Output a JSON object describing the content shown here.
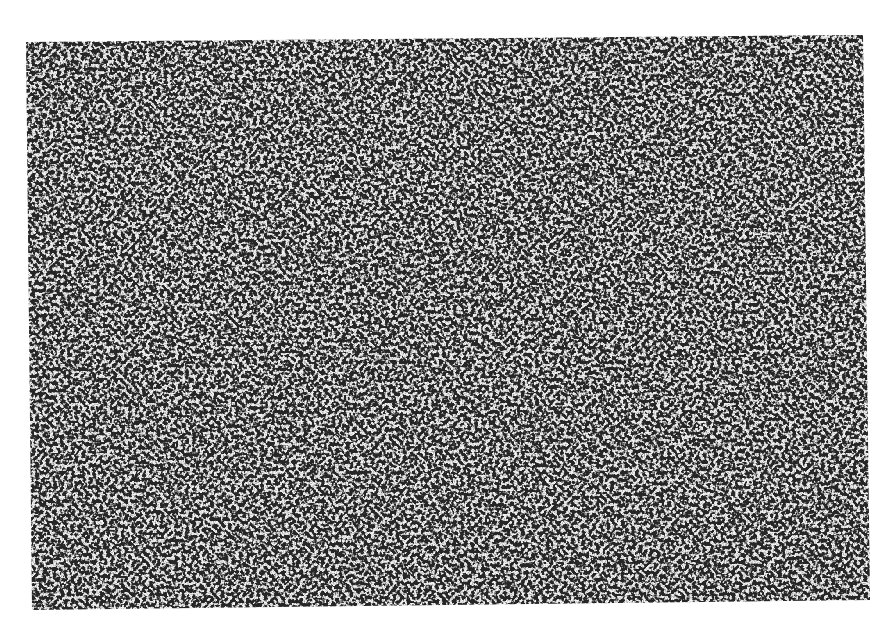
{
  "image": {
    "description": "Grayscale micrograph of densely packed round dark cell nuclei on a pale background",
    "colors": {
      "background": "#ffffff",
      "nucleus_dark": "#2a2a2a",
      "stroma_light": "#e8e8e8"
    },
    "region_corners": {
      "top_left": [
        26,
        42
      ],
      "top_right": [
        863,
        35
      ],
      "bottom_right": [
        870,
        600
      ],
      "bottom_left": [
        32,
        610
      ]
    }
  }
}
